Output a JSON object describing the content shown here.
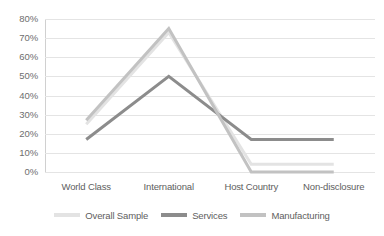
{
  "chart_data": {
    "type": "line",
    "title": "",
    "subtitle": "",
    "xlabel": "",
    "ylabel": "",
    "categories": [
      "World Class",
      "International",
      "Host Country",
      "Non-disclosure"
    ],
    "series": [
      {
        "name": "Overall Sample",
        "values": [
          25,
          73,
          4,
          4
        ],
        "color": "#e3e3e3"
      },
      {
        "name": "Services",
        "values": [
          17,
          50,
          17,
          17
        ],
        "color": "#8c8c8c"
      },
      {
        "name": "Manufacturing",
        "values": [
          27,
          75,
          0,
          0
        ],
        "color": "#c2c2c2"
      }
    ],
    "ylim": [
      0,
      80
    ],
    "ytick_step": 10,
    "ytick_labels": [
      "80%",
      "70%",
      "60%",
      "50%",
      "40%",
      "30%",
      "20%",
      "10%",
      "0%"
    ],
    "ytick_values": [
      80,
      70,
      60,
      50,
      40,
      30,
      20,
      10,
      0
    ],
    "grid": true,
    "grid_axis": "y",
    "legend_position": "bottom",
    "value_suffix": "%"
  },
  "axes": {
    "y_ticks": [
      {
        "label": "80%",
        "value": 80
      },
      {
        "label": "70%",
        "value": 70
      },
      {
        "label": "60%",
        "value": 60
      },
      {
        "label": "50%",
        "value": 50
      },
      {
        "label": "40%",
        "value": 40
      },
      {
        "label": "30%",
        "value": 30
      },
      {
        "label": "20%",
        "value": 20
      },
      {
        "label": "10%",
        "value": 10
      },
      {
        "label": "0%",
        "value": 0
      }
    ],
    "x_ticks": [
      {
        "label": "World Class"
      },
      {
        "label": "International"
      },
      {
        "label": "Host Country"
      },
      {
        "label": "Non-disclosure"
      }
    ]
  },
  "legend": {
    "items": [
      {
        "label": "Overall Sample",
        "color": "#e3e3e3"
      },
      {
        "label": "Services",
        "color": "#8c8c8c"
      },
      {
        "label": "Manufacturing",
        "color": "#c2c2c2"
      }
    ]
  },
  "style": {
    "background": "#ffffff",
    "gridline_color": "#e4e4e4",
    "axis_line_color": "#d0d0d0",
    "tick_label_color": "#6e6e6e",
    "legend_label_color": "#5e5e5e"
  }
}
